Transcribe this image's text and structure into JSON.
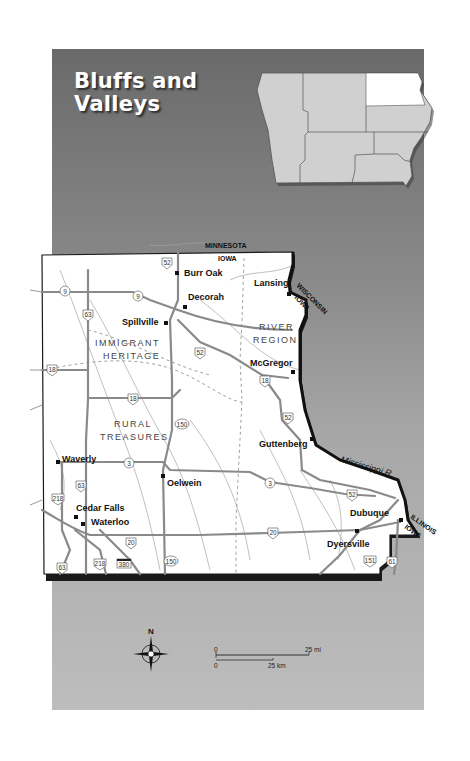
{
  "title": {
    "line1": "Bluffs and",
    "line2": "Valleys"
  },
  "inset_map": {
    "state": "Iowa",
    "highlighted_region": "Northeast"
  },
  "states": {
    "north": "MINNESOTA",
    "north_iowa": "IOWA",
    "east": "WISCONSIN",
    "east_iowa": "IOWA",
    "southeast": "ILLINOIS",
    "southeast_iowa": "IOWA"
  },
  "regions": {
    "immigrant_heritage": {
      "line1": "IMMIGRANT",
      "line2": "HERITAGE"
    },
    "river_region": {
      "line1": "RIVER",
      "line2": "REGION"
    },
    "rural_treasures": {
      "line1": "RURAL",
      "line2": "TREASURES"
    }
  },
  "cities": [
    {
      "name": "Burr Oak"
    },
    {
      "name": "Decorah"
    },
    {
      "name": "Spillville"
    },
    {
      "name": "Lansing"
    },
    {
      "name": "McGregor"
    },
    {
      "name": "Guttenberg"
    },
    {
      "name": "Waverly"
    },
    {
      "name": "Oelwein"
    },
    {
      "name": "Cedar Falls"
    },
    {
      "name": "Waterloo"
    },
    {
      "name": "Dubuque"
    },
    {
      "name": "Dyersville"
    }
  ],
  "river": {
    "name": "Mississippi R."
  },
  "routes": {
    "r52a": "52",
    "r9a": "9",
    "r9b": "9",
    "r63a": "63",
    "r52b": "52",
    "r18a": "18",
    "r18b": "18",
    "r18c": "18",
    "r150a": "150",
    "r52c": "52",
    "r3a": "3",
    "r3b": "3",
    "r52d": "52",
    "r63b": "63",
    "r218a": "218",
    "r20a": "20",
    "r20b": "20",
    "r63c": "63",
    "r218b": "218",
    "r380": "380",
    "r150b": "150",
    "r151": "151",
    "r61": "61"
  },
  "compass": {
    "north": "N"
  },
  "scale": {
    "mi_zero": "0",
    "mi_label": "25 mi",
    "km_zero": "0",
    "km_label": "25 km"
  }
}
